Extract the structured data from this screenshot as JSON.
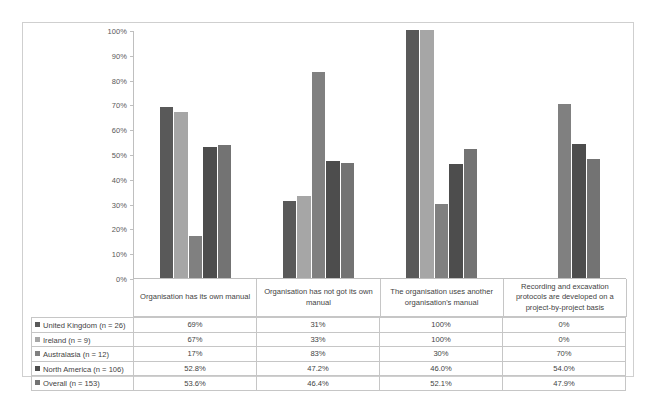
{
  "chart_data": {
    "type": "bar",
    "title": "",
    "xlabel": "",
    "ylabel": "",
    "ylim": [
      0,
      100
    ],
    "grid": false,
    "legend_position": "table-first-column",
    "y_ticks": [
      "0%",
      "10%",
      "20%",
      "30%",
      "40%",
      "50%",
      "60%",
      "70%",
      "80%",
      "90%",
      "100%"
    ],
    "y_tick_values": [
      0,
      10,
      20,
      30,
      40,
      50,
      60,
      70,
      80,
      90,
      100
    ],
    "categories": [
      "Organisation has its own manual",
      "Organisation has not got its own manual",
      "The organisation uses another organisation's manual",
      "Recording and excavation protocols are developed on a project-by-project basis"
    ],
    "series": [
      {
        "name": "United Kingdom (n = 26)",
        "color": "#595959",
        "values": [
          69,
          31,
          100,
          0
        ],
        "labels": [
          "69%",
          "31%",
          "100%",
          "0%"
        ]
      },
      {
        "name": "Ireland (n = 9)",
        "color": "#a6a6a6",
        "values": [
          67,
          33,
          100,
          0
        ],
        "labels": [
          "67%",
          "33%",
          "100%",
          "0%"
        ]
      },
      {
        "name": "Australasia (n = 12)",
        "color": "#808080",
        "values": [
          17,
          83,
          30,
          70
        ],
        "labels": [
          "17%",
          "83%",
          "30%",
          "70%"
        ]
      },
      {
        "name": "North America (n = 106)",
        "color": "#4d4d4d",
        "values": [
          52.8,
          47.2,
          46.0,
          54.0
        ],
        "labels": [
          "52.8%",
          "47.2%",
          "46.0%",
          "54.0%"
        ]
      },
      {
        "name": "Overall (n = 153)",
        "color": "#737373",
        "values": [
          53.6,
          46.4,
          52.1,
          47.9
        ],
        "labels": [
          "53.6%",
          "46.4%",
          "52.1%",
          "47.9%"
        ]
      }
    ]
  },
  "table": {
    "rows": [
      {
        "label": "United Kingdom (n = 26)",
        "swatch": "#595959",
        "values": [
          "69%",
          "31%",
          "100%",
          "0%"
        ]
      },
      {
        "label": "Ireland (n = 9)",
        "swatch": "#a6a6a6",
        "values": [
          "67%",
          "33%",
          "100%",
          "0%"
        ]
      },
      {
        "label": "Australasia (n = 12)",
        "swatch": "#808080",
        "values": [
          "17%",
          "83%",
          "30%",
          "70%"
        ]
      },
      {
        "label": "North America (n = 106)",
        "swatch": "#4d4d4d",
        "values": [
          "52.8%",
          "47.2%",
          "46.0%",
          "54.0%"
        ]
      },
      {
        "label": "Overall (n = 153)",
        "swatch": "#737373",
        "values": [
          "53.6%",
          "46.4%",
          "52.1%",
          "47.9%"
        ]
      }
    ]
  },
  "colors": {
    "axis": "#bfbfbf",
    "grid_border": "#c6c6c6",
    "frame": "#cfcfcf",
    "text": "#3f3f3f"
  }
}
